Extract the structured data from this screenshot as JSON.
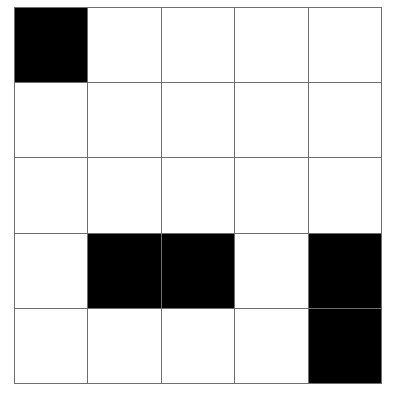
{
  "grid": {
    "rows": 5,
    "cols": 5,
    "colors": {
      "filled": "#000000",
      "empty": "#ffffff",
      "line": "#6e6e6e"
    },
    "cells": [
      [
        1,
        0,
        0,
        0,
        0
      ],
      [
        0,
        0,
        0,
        0,
        0
      ],
      [
        0,
        0,
        0,
        0,
        0
      ],
      [
        0,
        1,
        1,
        0,
        1
      ],
      [
        0,
        0,
        0,
        0,
        1
      ]
    ]
  }
}
